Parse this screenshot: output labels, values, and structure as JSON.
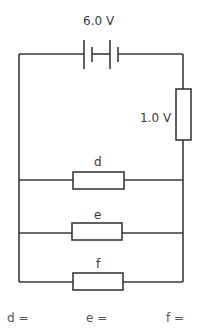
{
  "diagram": {
    "type": "circuit",
    "battery": {
      "label": "6.0 V"
    },
    "series_resistor": {
      "label": "1.0 V"
    },
    "parallel_resistors": [
      {
        "label": "d"
      },
      {
        "label": "e"
      },
      {
        "label": "f"
      }
    ],
    "answers": [
      {
        "label": "d ="
      },
      {
        "label": "e ="
      },
      {
        "label": "f ="
      }
    ],
    "colors": {
      "wire": "#3a3a3a",
      "background": "#ffffff"
    }
  }
}
